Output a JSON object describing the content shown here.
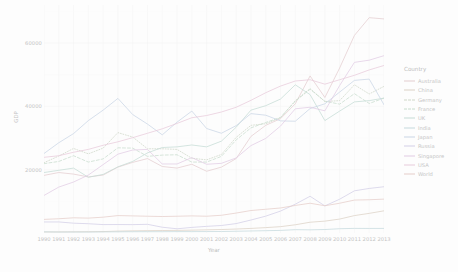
{
  "chart_data": {
    "type": "line",
    "title": "",
    "xlabel": "Year",
    "ylabel": "GDP",
    "xlim": [
      1990,
      2013
    ],
    "ylim": [
      0,
      72000
    ],
    "grid": true,
    "legend_position": "right",
    "legend_title": "Country",
    "x": [
      1990,
      1991,
      1992,
      1993,
      1994,
      1995,
      1996,
      1997,
      1998,
      1999,
      2000,
      2001,
      2002,
      2003,
      2004,
      2005,
      2006,
      2007,
      2008,
      2009,
      2010,
      2011,
      2012,
      2013
    ],
    "yticks": [
      20000,
      40000,
      60000
    ],
    "ytick_labels": [
      "20000",
      "40000",
      "60000"
    ],
    "xticks": [
      1990,
      1991,
      1992,
      1993,
      1994,
      1995,
      1996,
      1997,
      1998,
      1999,
      2000,
      2001,
      2002,
      2003,
      2004,
      2005,
      2006,
      2007,
      2008,
      2009,
      2010,
      2011,
      2012,
      2013
    ],
    "xtick_labels": [
      "1990",
      "1991",
      "1992",
      "1993",
      "1994",
      "1995",
      "1996",
      "1997",
      "1998",
      "1999",
      "2000",
      "2001",
      "2002",
      "2003",
      "2004",
      "2005",
      "2006",
      "2007",
      "2008",
      "2009",
      "2010",
      "2011",
      "2012",
      "2013"
    ],
    "series": [
      {
        "name": "Australia",
        "color": "#e4cdd0",
        "dash": "none",
        "values": [
          18200,
          19100,
          18600,
          17700,
          18300,
          20800,
          22300,
          23500,
          21000,
          20500,
          21700,
          19500,
          20800,
          23500,
          30500,
          34000,
          36100,
          40800,
          49600,
          42800,
          52100,
          62400,
          68000,
          67600
        ]
      },
      {
        "name": "China",
        "color": "#dcd2c6",
        "dash": "none",
        "values": [
          320,
          340,
          370,
          400,
          450,
          600,
          680,
          740,
          780,
          820,
          900,
          1000,
          1100,
          1250,
          1450,
          1700,
          2000,
          2600,
          3400,
          3750,
          4400,
          5500,
          6200,
          7000
        ]
      },
      {
        "name": "Germany",
        "color": "#cfd7c8",
        "dash": "dot",
        "values": [
          22200,
          24300,
          26700,
          25000,
          26800,
          31700,
          30300,
          26600,
          26600,
          26400,
          23600,
          23100,
          24800,
          30200,
          34000,
          34500,
          36400,
          41800,
          45600,
          41500,
          41800,
          46800,
          43900,
          46300
        ]
      },
      {
        "name": "France",
        "color": "#c8dccd",
        "dash": "dash",
        "values": [
          21900,
          22600,
          24400,
          22400,
          23400,
          26900,
          26800,
          24200,
          24600,
          24700,
          22400,
          22400,
          24200,
          29400,
          33200,
          34900,
          36500,
          41600,
          45400,
          41600,
          40700,
          44000,
          40900,
          42600
        ]
      },
      {
        "name": "UK",
        "color": "#c6dcd6",
        "dash": "none",
        "values": [
          19100,
          19800,
          20500,
          17600,
          18500,
          20900,
          22600,
          25300,
          27000,
          27200,
          27800,
          27200,
          29000,
          33400,
          38800,
          40200,
          42300,
          46800,
          43700,
          35500,
          38500,
          41400,
          41800,
          42600
        ]
      },
      {
        "name": "India",
        "color": "#c6dade",
        "dash": "none",
        "values": [
          370,
          300,
          310,
          300,
          340,
          370,
          400,
          410,
          410,
          440,
          440,
          450,
          470,
          550,
          640,
          730,
          820,
          1050,
          1000,
          1100,
          1350,
          1460,
          1440,
          1450
        ]
      },
      {
        "name": "Japan",
        "color": "#c9d6e6",
        "dash": "none",
        "values": [
          25100,
          28500,
          31400,
          35500,
          38800,
          42500,
          37400,
          34400,
          31000,
          35000,
          38500,
          33000,
          31500,
          33900,
          37700,
          37200,
          35400,
          35300,
          39300,
          40800,
          44500,
          48200,
          48600,
          40500
        ]
      },
      {
        "name": "Russia",
        "color": "#d3cfe7",
        "dash": "none",
        "values": [
          3490,
          3490,
          3100,
          2930,
          2660,
          2670,
          2640,
          2740,
          1830,
          1330,
          1770,
          2100,
          2370,
          2970,
          4100,
          5320,
          6920,
          9100,
          11600,
          8560,
          10670,
          13320,
          14070,
          14610
        ]
      },
      {
        "name": "Singapore",
        "color": "#e1cce4",
        "dash": "none",
        "values": [
          11860,
          14500,
          16100,
          18300,
          21600,
          24900,
          26200,
          26400,
          21800,
          21800,
          23800,
          21700,
          22000,
          23700,
          27600,
          29870,
          33770,
          39220,
          39720,
          38580,
          46570,
          53890,
          54580,
          56000
        ]
      },
      {
        "name": "USA",
        "color": "#e8cbdb",
        "dash": "none",
        "values": [
          23900,
          24400,
          25500,
          26400,
          27700,
          28800,
          30100,
          31500,
          32900,
          34600,
          36400,
          37100,
          38200,
          39700,
          41900,
          44300,
          46400,
          48000,
          48400,
          47000,
          48400,
          49800,
          51500,
          52900
        ]
      },
      {
        "name": "World",
        "color": "#e5cdc9",
        "dash": "none",
        "values": [
          4300,
          4500,
          4800,
          4700,
          5000,
          5500,
          5400,
          5300,
          5200,
          5300,
          5400,
          5300,
          5600,
          6300,
          7100,
          7500,
          7900,
          8700,
          9400,
          8600,
          9400,
          10400,
          10500,
          10700
        ]
      }
    ]
  },
  "axes": {
    "y_title": "GDP",
    "x_title": "Year"
  },
  "legend": {
    "title": "Country",
    "entries": [
      {
        "label": "Australia"
      },
      {
        "label": "China"
      },
      {
        "label": "Germany"
      },
      {
        "label": "France"
      },
      {
        "label": "UK"
      },
      {
        "label": "India"
      },
      {
        "label": "Japan"
      },
      {
        "label": "Russia"
      },
      {
        "label": "Singapore"
      },
      {
        "label": "USA"
      },
      {
        "label": "World"
      }
    ]
  }
}
